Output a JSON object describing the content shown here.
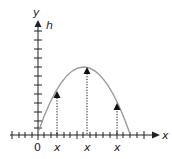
{
  "diagram": {
    "type": "projectile-trajectory",
    "axes": {
      "y_label": "y",
      "y_secondary_label": "h",
      "x_label": "x",
      "origin_label": "0"
    },
    "x_tick_labels": [
      "x",
      "x",
      "x"
    ],
    "colors": {
      "axis": "#222222",
      "curve": "#9a9a9a",
      "arrow": "#111111",
      "background": "#ffffff"
    },
    "markers": [
      {
        "label": "x",
        "description": "dotted height arrow on rising side"
      },
      {
        "label": "x",
        "description": "dotted height arrow at apex"
      },
      {
        "label": "x",
        "description": "dotted height arrow on falling side"
      }
    ]
  }
}
